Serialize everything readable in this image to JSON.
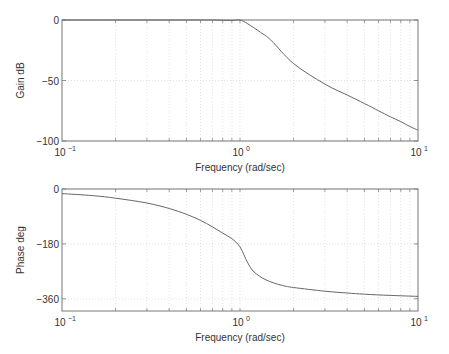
{
  "chart_data": [
    {
      "type": "line",
      "title": "",
      "xlabel": "Frequency (rad/sec)",
      "ylabel": "Gain dB",
      "xscale": "log",
      "xlim": [
        0.1,
        10
      ],
      "ylim": [
        -100,
        0
      ],
      "grid": true,
      "x_ticks": [
        {
          "value": 0.1,
          "base": "10",
          "exp": "-1"
        },
        {
          "value": 1,
          "base": "10",
          "exp": "0"
        },
        {
          "value": 10,
          "base": "10",
          "exp": "1"
        }
      ],
      "y_ticks": [
        {
          "value": 0,
          "label": "0"
        },
        {
          "value": -50,
          "label": "-50"
        },
        {
          "value": -100,
          "label": "-100"
        }
      ],
      "series": [
        {
          "name": "gain",
          "x": [
            0.1,
            0.2,
            0.3,
            0.5,
            0.7,
            0.9,
            1.0,
            1.1,
            1.3,
            1.5,
            2,
            3,
            4,
            5,
            6,
            7,
            8,
            9,
            10
          ],
          "y": [
            0,
            0,
            0,
            0,
            0,
            -0.3,
            0,
            -3,
            -10,
            -17,
            -36,
            -53,
            -62,
            -69,
            -75,
            -80,
            -84,
            -88,
            -91
          ]
        }
      ]
    },
    {
      "type": "line",
      "title": "",
      "xlabel": "Frequency (rad/sec)",
      "ylabel": "Phase deg",
      "xscale": "log",
      "xlim": [
        0.1,
        10
      ],
      "ylim": [
        -400,
        0
      ],
      "grid": true,
      "x_ticks": [
        {
          "value": 0.1,
          "base": "10",
          "exp": "-1"
        },
        {
          "value": 1,
          "base": "10",
          "exp": "0"
        },
        {
          "value": 10,
          "base": "10",
          "exp": "1"
        }
      ],
      "y_ticks": [
        {
          "value": 0,
          "label": "0"
        },
        {
          "value": -180,
          "label": "-180"
        },
        {
          "value": -360,
          "label": "-360"
        }
      ],
      "series": [
        {
          "name": "phase",
          "x": [
            0.1,
            0.15,
            0.2,
            0.3,
            0.4,
            0.5,
            0.6,
            0.7,
            0.8,
            0.9,
            1.0,
            1.1,
            1.2,
            1.4,
            1.7,
            2,
            3,
            4,
            5,
            7,
            10
          ],
          "y": [
            -15,
            -22,
            -30,
            -46,
            -64,
            -83,
            -103,
            -124,
            -145,
            -163,
            -190,
            -240,
            -272,
            -298,
            -315,
            -323,
            -335,
            -341,
            -345,
            -349,
            -352
          ]
        }
      ]
    }
  ]
}
